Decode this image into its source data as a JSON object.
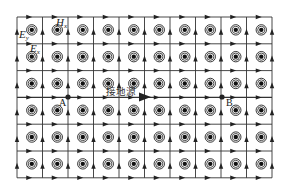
{
  "diagram": {
    "grid": {
      "x0": 17,
      "y0": 17,
      "cols": 10,
      "rows": 6,
      "cell_w": 25.5,
      "cell_h": 26.8,
      "line_color": "#333333"
    },
    "symbols": {
      "type": "out-of-page dot (double circle with filled core)",
      "count_per_row": 10,
      "rows": 6
    },
    "labels": {
      "ey": "E",
      "ey_sub": "y",
      "hx": "H",
      "hx_sub": "x",
      "ex": "E",
      "ex_sub": "x",
      "point_a": "A",
      "point_b": "B",
      "center_label": "接地源"
    },
    "path": {
      "from": "A",
      "to": "B",
      "arrow_color": "#222222"
    }
  }
}
